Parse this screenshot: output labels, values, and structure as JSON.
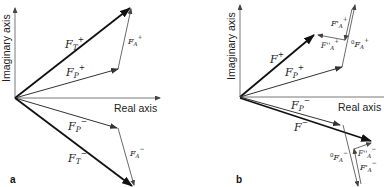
{
  "panels": [
    {
      "id": "a",
      "label": "a",
      "axes": {
        "x_label": "Real axis",
        "y_label": "Imaginary axis"
      },
      "vectors": [
        {
          "name": "F_T+",
          "text": "F",
          "sub": "T",
          "sup": "+"
        },
        {
          "name": "F_P+",
          "text": "F",
          "sub": "P",
          "sup": "+"
        },
        {
          "name": "F_A+",
          "text": "F",
          "sub": "A",
          "sup": "+"
        },
        {
          "name": "F_P-",
          "text": "F",
          "sub": "P",
          "sup": "−"
        },
        {
          "name": "F_T-",
          "text": "F",
          "sub": "T",
          "sup": "−"
        },
        {
          "name": "F_A-",
          "text": "F",
          "sub": "A",
          "sup": "−"
        }
      ]
    },
    {
      "id": "b",
      "label": "b",
      "axes": {
        "x_label": "Real axis",
        "y_label": "Imaginary axis"
      },
      "vectors": [
        {
          "name": "F+",
          "text": "F",
          "sub": "",
          "sup": "+"
        },
        {
          "name": "F_P+",
          "text": "F",
          "sub": "P",
          "sup": "+"
        },
        {
          "name": "F'_A+",
          "text": "F'",
          "sub": "A",
          "sup": "+"
        },
        {
          "name": "F''_A+",
          "text": "F''",
          "sub": "A",
          "sup": "+"
        },
        {
          "name": "0F_A+",
          "pre": "0",
          "text": "F",
          "sub": "A",
          "sup": "+"
        },
        {
          "name": "F_P-",
          "text": "F",
          "sub": "P",
          "sup": "−"
        },
        {
          "name": "F-",
          "text": "F",
          "sub": "",
          "sup": "−"
        },
        {
          "name": "0F_A-",
          "pre": "0",
          "text": "F",
          "sub": "A",
          "sup": "−"
        },
        {
          "name": "F''_A-",
          "text": "F''",
          "sub": "A",
          "sup": "−"
        },
        {
          "name": "F'_A-",
          "text": "F'",
          "sub": "A",
          "sup": "−"
        }
      ]
    }
  ]
}
